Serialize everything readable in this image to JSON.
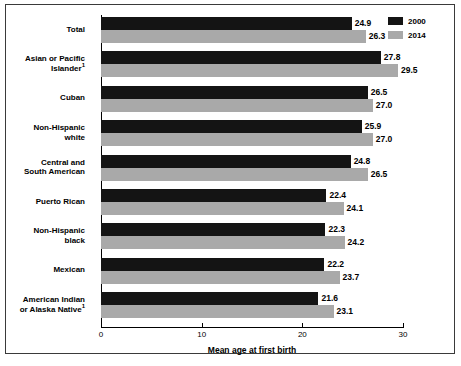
{
  "chart_data": {
    "type": "bar",
    "orientation": "horizontal",
    "title": "",
    "xlabel": "Mean age at first birth",
    "ylabel": "",
    "xlim": [
      0,
      30
    ],
    "xticks": [
      0,
      10,
      20,
      30
    ],
    "xticklabels": [
      "0",
      "10",
      "20",
      "30"
    ],
    "grid": false,
    "legend_position": "top-right",
    "categories": [
      "Total",
      "Asian or Pacific Islander¹",
      "Cuban",
      "Non-Hispanic white",
      "Central and South American",
      "Puerto Rican",
      "Non-Hispanic black",
      "Mexican",
      "American Indian or Alaska Native¹"
    ],
    "series": [
      {
        "name": "2000",
        "color": "#141414",
        "values": [
          24.9,
          27.8,
          26.5,
          25.9,
          24.8,
          22.4,
          22.3,
          22.2,
          21.6
        ]
      },
      {
        "name": "2014",
        "color": "#a9a9a9",
        "values": [
          26.3,
          29.5,
          27.0,
          27.0,
          26.5,
          24.1,
          24.2,
          23.7,
          23.1
        ]
      }
    ]
  },
  "legend": {
    "items": [
      {
        "label": "2000",
        "color": "#141414"
      },
      {
        "label": "2014",
        "color": "#a9a9a9"
      }
    ]
  },
  "axis": {
    "x_title": "Mean age at first birth",
    "tick_0": "0",
    "tick_10": "10",
    "tick_20": "20",
    "tick_30": "30"
  },
  "category_labels": [
    {
      "line1": "Total",
      "line2": "",
      "sup": ""
    },
    {
      "line1": "Asian or Pacific",
      "line2": "Islander",
      "sup": "1"
    },
    {
      "line1": "Cuban",
      "line2": "",
      "sup": ""
    },
    {
      "line1": "Non-Hispanic",
      "line2": "white",
      "sup": ""
    },
    {
      "line1": "Central and",
      "line2": "South American",
      "sup": ""
    },
    {
      "line1": "Puerto Rican",
      "line2": "",
      "sup": ""
    },
    {
      "line1": "Non-Hispanic",
      "line2": "black",
      "sup": ""
    },
    {
      "line1": "Mexican",
      "line2": "",
      "sup": ""
    },
    {
      "line1": "American Indian",
      "line2": "or Alaska Native",
      "sup": "1"
    }
  ],
  "value_labels": {
    "s2000": [
      "24.9",
      "27.8",
      "26.5",
      "25.9",
      "24.8",
      "22.4",
      "22.3",
      "22.2",
      "21.6"
    ],
    "s2014": [
      "26.3",
      "29.5",
      "27.0",
      "27.0",
      "26.5",
      "24.1",
      "24.2",
      "23.7",
      "23.1"
    ]
  }
}
